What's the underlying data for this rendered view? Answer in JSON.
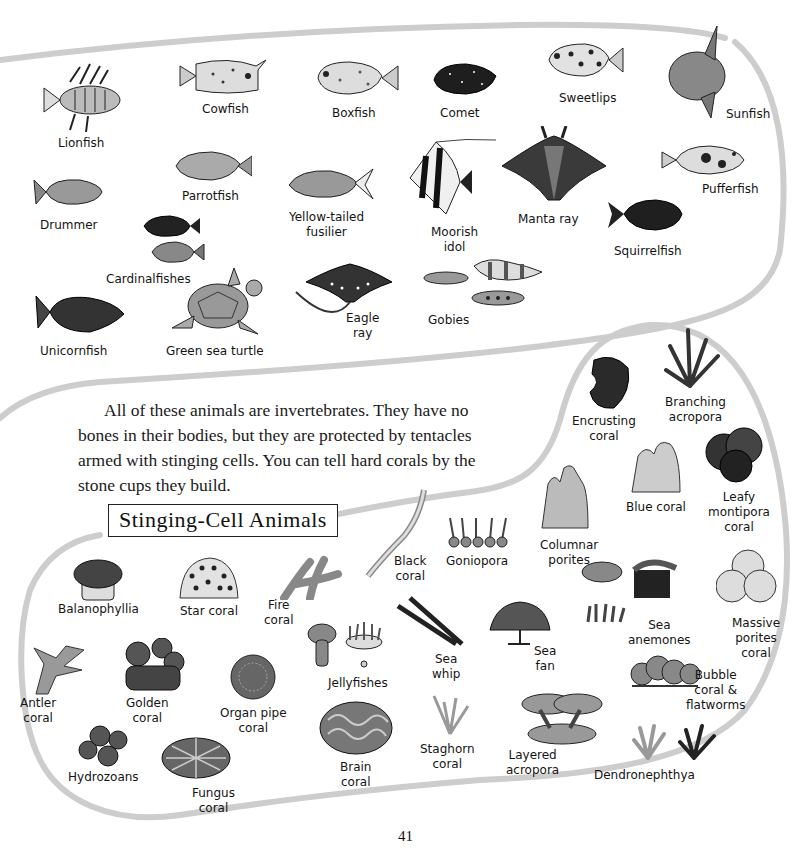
{
  "page": {
    "page_number": "41",
    "paragraph": "All of these animals are invertebrates. They have no bones in their bodies, but they are protected by tentacles armed with stinging cells. You can tell hard corals by the stone cups they build.",
    "section_heading": "Stinging-Cell Animals"
  },
  "fish_section": {
    "labels": [
      {
        "id": "lionfish",
        "text": "Lionfish"
      },
      {
        "id": "cowfish",
        "text": "Cowfish"
      },
      {
        "id": "boxfish",
        "text": "Boxfish"
      },
      {
        "id": "comet",
        "text": "Comet"
      },
      {
        "id": "sweetlips",
        "text": "Sweetlips"
      },
      {
        "id": "sunfish",
        "text": "Sunfish"
      },
      {
        "id": "drummer",
        "text": "Drummer"
      },
      {
        "id": "parrotfish",
        "text": "Parrotfish"
      },
      {
        "id": "yellow_tailed_fusilier",
        "text": "Yellow-tailed\nfusilier"
      },
      {
        "id": "moorish_idol",
        "text": "Moorish\nidol"
      },
      {
        "id": "manta_ray",
        "text": "Manta ray"
      },
      {
        "id": "pufferfish",
        "text": "Pufferfish"
      },
      {
        "id": "squirrelfish",
        "text": "Squirrelfish"
      },
      {
        "id": "cardinalfishes",
        "text": "Cardinalfishes"
      },
      {
        "id": "unicornfish",
        "text": "Unicornfish"
      },
      {
        "id": "green_sea_turtle",
        "text": "Green sea turtle"
      },
      {
        "id": "eagle_ray",
        "text": "Eagle\nray"
      },
      {
        "id": "gobies",
        "text": "Gobies"
      }
    ]
  },
  "coral_section": {
    "labels": [
      {
        "id": "encrusting_coral",
        "text": "Encrusting\ncoral"
      },
      {
        "id": "branching_acropora",
        "text": "Branching\nacropora"
      },
      {
        "id": "blue_coral",
        "text": "Blue coral"
      },
      {
        "id": "leafy_montipora_coral",
        "text": "Leafy\nmontipora\ncoral"
      },
      {
        "id": "columnar_porites",
        "text": "Columnar\nporites"
      },
      {
        "id": "black_coral",
        "text": "Black\ncoral"
      },
      {
        "id": "goniopora",
        "text": "Goniopora"
      },
      {
        "id": "balanophyllia",
        "text": "Balanophyllia"
      },
      {
        "id": "star_coral",
        "text": "Star coral"
      },
      {
        "id": "fire_coral",
        "text": "Fire\ncoral"
      },
      {
        "id": "jellyfishes",
        "text": "Jellyfishes"
      },
      {
        "id": "sea_whip",
        "text": "Sea\nwhip"
      },
      {
        "id": "sea_fan",
        "text": "Sea\nfan"
      },
      {
        "id": "sea_anemones",
        "text": "Sea\nanemones"
      },
      {
        "id": "massive_porites_coral",
        "text": "Massive\nporites\ncoral"
      },
      {
        "id": "antler_coral",
        "text": "Antler\ncoral"
      },
      {
        "id": "golden_coral",
        "text": "Golden\ncoral"
      },
      {
        "id": "organ_pipe_coral",
        "text": "Organ pipe\ncoral"
      },
      {
        "id": "bubble_coral_flatworms",
        "text": "Bubble\ncoral &\nflatworms"
      },
      {
        "id": "hydrozoans",
        "text": "Hydrozoans"
      },
      {
        "id": "fungus_coral",
        "text": "Fungus\ncoral"
      },
      {
        "id": "brain_coral",
        "text": "Brain\ncoral"
      },
      {
        "id": "staghorn_coral",
        "text": "Staghorn\ncoral"
      },
      {
        "id": "layered_acropora",
        "text": "Layered\nacropora"
      },
      {
        "id": "dendronephthya",
        "text": "Dendronephthya"
      }
    ]
  },
  "colors": {
    "border": "#c9c9c9",
    "ink": "#1a1a1a",
    "dark_fill": "#2a2a2a",
    "mid_fill": "#7a7a7a",
    "light_fill": "#cfcfcf"
  }
}
